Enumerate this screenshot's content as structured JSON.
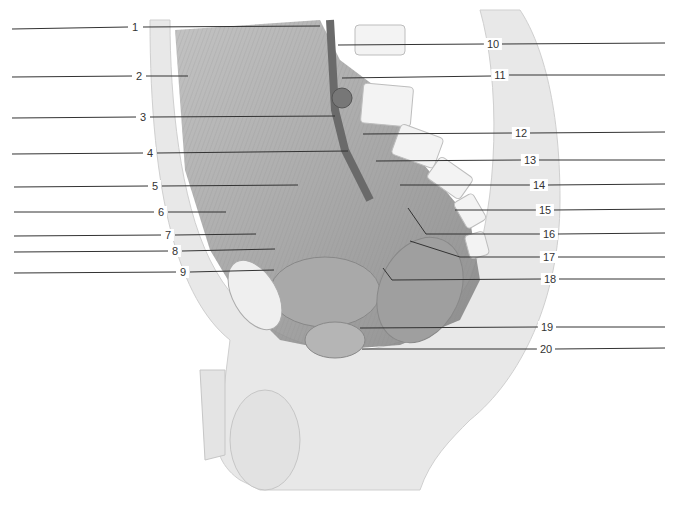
{
  "diagram": {
    "type": "anatomical-illustration",
    "palette": {
      "background": "#ffffff",
      "skin": "#e6e6e6",
      "muscle": "#9a9a9a",
      "bone": "#f2f2f2",
      "line": "#333333"
    },
    "left_labels": [
      {
        "n": "1",
        "y": 27,
        "x": 135
      },
      {
        "n": "2",
        "y": 76,
        "x": 139
      },
      {
        "n": "3",
        "y": 117,
        "x": 143
      },
      {
        "n": "4",
        "y": 153,
        "x": 150
      },
      {
        "n": "5",
        "y": 186,
        "x": 155
      },
      {
        "n": "6",
        "y": 212,
        "x": 161
      },
      {
        "n": "7",
        "y": 235,
        "x": 168
      },
      {
        "n": "8",
        "y": 251,
        "x": 175
      },
      {
        "n": "9",
        "y": 272,
        "x": 183
      }
    ],
    "right_labels": [
      {
        "n": "10",
        "y": 44,
        "x": 493
      },
      {
        "n": "11",
        "y": 75,
        "x": 500
      },
      {
        "n": "12",
        "y": 133,
        "x": 521
      },
      {
        "n": "13",
        "y": 160,
        "x": 530
      },
      {
        "n": "14",
        "y": 185,
        "x": 539
      },
      {
        "n": "15",
        "y": 210,
        "x": 545
      },
      {
        "n": "16",
        "y": 234,
        "x": 549
      },
      {
        "n": "17",
        "y": 257,
        "x": 549
      },
      {
        "n": "18",
        "y": 279,
        "x": 550
      },
      {
        "n": "19",
        "y": 327,
        "x": 547
      },
      {
        "n": "20",
        "y": 349,
        "x": 546
      }
    ]
  }
}
